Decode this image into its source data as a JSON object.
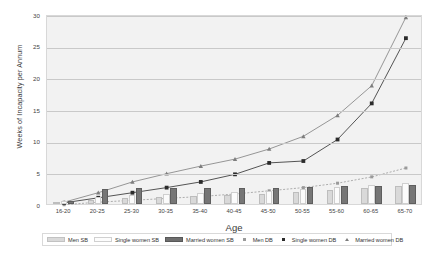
{
  "chart_data": {
    "type": "bar",
    "title": "",
    "xlabel": "Age",
    "ylabel": "Weeks of Incapacity per Annum",
    "categories": [
      "16-20",
      "20-25",
      "25-30",
      "30-35",
      "35-40",
      "40-45",
      "45-50",
      "50-55",
      "55-60",
      "60-65",
      "65-70"
    ],
    "ylim": [
      0,
      30
    ],
    "yticks": [
      0,
      5,
      10,
      15,
      20,
      25,
      30
    ],
    "grid": true,
    "legend_position": "bottom",
    "bar_series": [
      {
        "name": "Men SB",
        "color": "#d9d9d9",
        "values": [
          0.3,
          0.7,
          1.0,
          1.1,
          1.2,
          1.4,
          1.6,
          1.9,
          2.2,
          2.6,
          2.9
        ]
      },
      {
        "name": "Single women SB",
        "color": "#fbfbfb",
        "values": [
          0.4,
          1.1,
          1.5,
          1.6,
          1.7,
          1.9,
          2.1,
          2.4,
          2.7,
          3.0,
          3.3
        ]
      },
      {
        "name": "Married women SB",
        "color": "#767676",
        "values": [
          0.4,
          2.4,
          2.5,
          2.5,
          2.5,
          2.6,
          2.6,
          2.7,
          2.8,
          2.9,
          3.0
        ]
      }
    ],
    "line_series": [
      {
        "name": "Men DB",
        "color": "#9a9a9a",
        "marker": "square-small",
        "dash": "dotted",
        "values": [
          0.2,
          0.6,
          0.9,
          1.2,
          1.5,
          1.9,
          2.4,
          2.9,
          3.6,
          4.6,
          6.0
        ]
      },
      {
        "name": "Single women DB",
        "color": "#2b2b2b",
        "marker": "square",
        "dash": "solid",
        "values": [
          0.5,
          1.3,
          2.1,
          2.9,
          3.8,
          5.0,
          6.8,
          7.1,
          10.5,
          16.2,
          26.5
        ]
      },
      {
        "name": "Married women DB",
        "color": "#7d7d7d",
        "marker": "triangle",
        "dash": "solid",
        "values": [
          0.6,
          2.1,
          3.8,
          5.1,
          6.3,
          7.4,
          9.0,
          11.0,
          14.3,
          19.0,
          29.8
        ]
      }
    ]
  },
  "legend": {
    "items": [
      {
        "label": "Men SB"
      },
      {
        "label": "Single women SB"
      },
      {
        "label": "Married women SB"
      },
      {
        "label": "Men DB"
      },
      {
        "label": "Single women DB"
      },
      {
        "label": "Married women DB"
      }
    ]
  }
}
